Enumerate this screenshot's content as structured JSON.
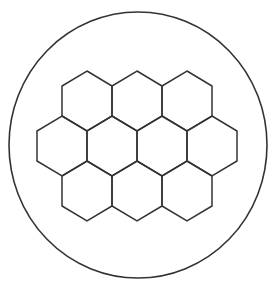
{
  "diagram": {
    "stroke_color": "#333333",
    "background_color": "#ffffff",
    "circle": {
      "cx": 138,
      "cy": 145,
      "rx": 129,
      "ry": 133
    },
    "hexagon": {
      "half_width": 25,
      "half_height": 30,
      "side_offset": 15
    },
    "rows": [
      {
        "name": "top",
        "cy": 101,
        "centers_x": [
          87,
          137,
          187
        ]
      },
      {
        "name": "middle",
        "cy": 146,
        "centers_x": [
          62,
          112,
          162,
          212
        ]
      },
      {
        "name": "bottom",
        "cy": 191,
        "centers_x": [
          87,
          137,
          187
        ]
      }
    ],
    "hexagon_count": 10
  }
}
